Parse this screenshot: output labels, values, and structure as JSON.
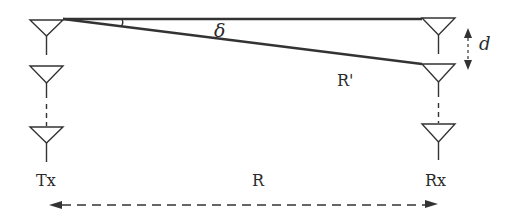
{
  "diagram": {
    "type": "antenna-array-geometry",
    "labels": {
      "tx": "Tx",
      "rx": "Rx",
      "range": "R",
      "slant_range": "R'",
      "angle": "δ",
      "spacing": "d"
    },
    "colors": {
      "stroke": "#333333",
      "text": "#2a2a2a",
      "background": "#ffffff"
    },
    "tx_array": {
      "elements": 3,
      "has_ellipsis_dashes": true
    },
    "rx_array": {
      "elements": 3,
      "has_ellipsis_dashes": true
    }
  }
}
